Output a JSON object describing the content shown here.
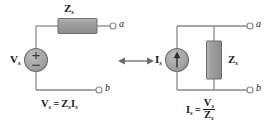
{
  "figure": {
    "type": "circuit-diagram",
    "equivalence_symbol": "double-headed-arrow"
  },
  "colors": {
    "wire": "#8a8a8a",
    "component_fill": "#9a9a9a",
    "component_stroke": "#6e6e6e",
    "text": "#1a1a1a",
    "background": "#ffffff"
  },
  "left_circuit": {
    "name": "thevenin-equivalent",
    "source": {
      "label_main": "V",
      "label_sub": "s",
      "plus_sign": "+",
      "minus_sign": "−",
      "kind": "voltage-source"
    },
    "impedance": {
      "label_main": "Z",
      "label_sub": "s",
      "orientation": "horizontal"
    },
    "terminals": [
      {
        "name": "terminal-a",
        "letter": "a"
      },
      {
        "name": "terminal-b",
        "letter": "b"
      }
    ],
    "equation": {
      "lhs_main": "V",
      "lhs_sub": "s",
      "operator": "=",
      "rhs_first_main": "Z",
      "rhs_first_sub": "s",
      "rhs_second_main": "I",
      "rhs_second_sub": "s",
      "plain": "Vs = Zs Is"
    }
  },
  "right_circuit": {
    "name": "norton-equivalent",
    "source": {
      "label_main": "I",
      "label_sub": "s",
      "kind": "current-source",
      "arrow_direction": "up"
    },
    "impedance": {
      "label_main": "Z",
      "label_sub": "s",
      "orientation": "vertical"
    },
    "terminals": [
      {
        "name": "terminal-a",
        "letter": "a"
      },
      {
        "name": "terminal-b",
        "letter": "b"
      }
    ],
    "equation": {
      "lhs_main": "I",
      "lhs_sub": "s",
      "operator": "=",
      "numerator_main": "V",
      "numerator_sub": "s",
      "denominator_main": "Z",
      "denominator_sub": "s",
      "plain": "Is = Vs / Zs"
    }
  }
}
